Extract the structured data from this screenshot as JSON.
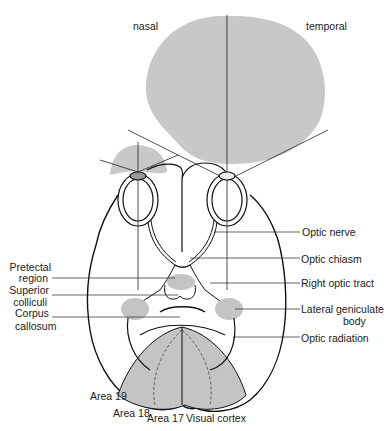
{
  "diagram": {
    "type": "anatomical-diagram",
    "colors": {
      "field_fill": "#c8c8c8",
      "region_fill": "#c4c4c4",
      "line": "#111111",
      "label_text": "#222222",
      "background": "#ffffff"
    },
    "field_labels": {
      "nasal": "nasal",
      "temporal": "temporal"
    },
    "left_labels": [
      {
        "id": "pretectal",
        "line1": "Pretectal",
        "line2": "region"
      },
      {
        "id": "superior-colliculi",
        "line1": "Superior",
        "line2": "colliculi"
      },
      {
        "id": "corpus-callosum",
        "line1": "Corpus",
        "line2": "callosum"
      }
    ],
    "right_labels": [
      {
        "id": "optic-nerve",
        "line1": "Optic nerve"
      },
      {
        "id": "optic-chiasm",
        "line1": "Optic chiasm"
      },
      {
        "id": "right-optic-tract",
        "line1": "Right optic tract"
      },
      {
        "id": "lateral-geniculate",
        "line1": "Lateral geniculate",
        "line2": "body"
      },
      {
        "id": "optic-radiation",
        "line1": "Optic radiation"
      }
    ],
    "bottom_labels": {
      "area19": "Area 19",
      "area18": "Area 18",
      "area17": "Area 17",
      "visual_cortex": "Visual cortex"
    }
  }
}
